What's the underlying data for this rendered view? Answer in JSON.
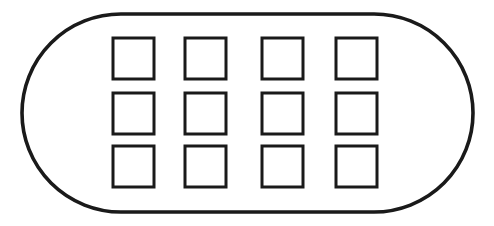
{
  "figure": {
    "kind": "line-drawing",
    "render_style": "scanned-lineart",
    "canvas": {
      "width": 494,
      "height": 226
    },
    "colors": {
      "background": "#ffffff",
      "stroke": "#1a1a1a",
      "fill": "#ffffff"
    },
    "outline": {
      "shape": "stadium",
      "x": 22,
      "y": 14,
      "width": 451,
      "height": 198,
      "corner_radius": 99,
      "stroke_width": 3.6,
      "fill": "none"
    },
    "grid": {
      "columns": 4,
      "rows": 3,
      "count": 12,
      "square_size": 41,
      "stroke_width": 3,
      "column_x": [
        113,
        185,
        262,
        336
      ],
      "row_y": [
        38,
        93,
        146
      ],
      "cells": [
        {
          "row": 1,
          "col": 1,
          "x": 113,
          "y": 38,
          "w": 41,
          "h": 41
        },
        {
          "row": 1,
          "col": 2,
          "x": 185,
          "y": 38,
          "w": 41,
          "h": 41
        },
        {
          "row": 1,
          "col": 3,
          "x": 262,
          "y": 38,
          "w": 41,
          "h": 41
        },
        {
          "row": 1,
          "col": 4,
          "x": 336,
          "y": 38,
          "w": 41,
          "h": 41
        },
        {
          "row": 2,
          "col": 1,
          "x": 113,
          "y": 93,
          "w": 41,
          "h": 41
        },
        {
          "row": 2,
          "col": 2,
          "x": 185,
          "y": 93,
          "w": 41,
          "h": 41
        },
        {
          "row": 2,
          "col": 3,
          "x": 262,
          "y": 93,
          "w": 41,
          "h": 41
        },
        {
          "row": 2,
          "col": 4,
          "x": 336,
          "y": 93,
          "w": 41,
          "h": 41
        },
        {
          "row": 3,
          "col": 1,
          "x": 113,
          "y": 146,
          "w": 41,
          "h": 41
        },
        {
          "row": 3,
          "col": 2,
          "x": 185,
          "y": 146,
          "w": 41,
          "h": 41
        },
        {
          "row": 3,
          "col": 3,
          "x": 262,
          "y": 146,
          "w": 41,
          "h": 41
        },
        {
          "row": 3,
          "col": 4,
          "x": 336,
          "y": 146,
          "w": 41,
          "h": 41
        }
      ]
    }
  }
}
